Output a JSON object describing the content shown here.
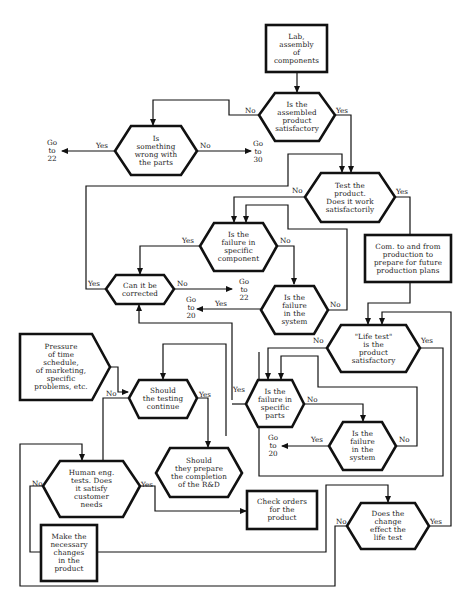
{
  "diagram": {
    "type": "flowchart",
    "nodes": {
      "lab_assembly": "Lab,\nassembly\nof\ncomponents",
      "assembled_satisfactory": "Is the\nassembled\nproduct\nsatisfactory",
      "wrong_with_parts": "Is\nsomething\nwrong with\nthe parts",
      "test_product": "Test the\nproduct.\nDoes it work\nsatisfactorily",
      "failure_component": "Is the\nfailure in\nspecific\ncomponent",
      "can_be_corrected": "Can it be\ncorrected",
      "failure_system_1": "Is the\nfailure\nin the\nsystem",
      "com_production": "Com. to and from\nproduction to\nprepare for future\nproduction plans",
      "life_test": "\"Life test\"\nis the\nproduct\nsatisfactory",
      "pressure": "Pressure\nof time\nschedule,\nof marketing,\nspecific\nproblems, etc.",
      "testing_continue": "Should\nthe testing\ncontinue",
      "failure_parts": "Is the\nfailure in\nspecific\nparts",
      "failure_system_2": "Is the\nfailure\nin the\nsystem",
      "prepare_completion": "Should\nthey prepare\nthe completion\nof the R&D",
      "human_eng": "Human eng.\ntests. Does\nit satisfy\ncustomer\nneeds",
      "check_orders": "Check orders\nfor the\nproduct",
      "change_effect": "Does the\nchange\neffect the\nlife test",
      "make_changes": "Make the\nnecessary\nchanges\nin the\nproduct"
    },
    "labels": {
      "yes": "Yes",
      "no": "No",
      "goto_22": "Go\nto\n22",
      "goto_30": "Go\nto\n30",
      "goto_20": "Go\nto\n20"
    }
  }
}
